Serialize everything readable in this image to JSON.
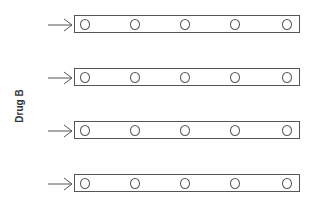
{
  "diagram": {
    "axis_label": "Drug B",
    "rows": [
      {
        "wells": 5
      },
      {
        "wells": 5
      },
      {
        "wells": 5
      },
      {
        "wells": 5
      }
    ]
  }
}
